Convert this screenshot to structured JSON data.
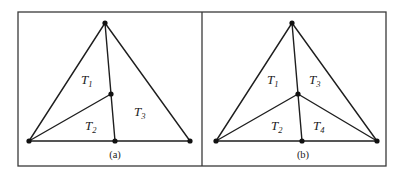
{
  "figure": {
    "panels": [
      {
        "id": "a",
        "caption": "(a)",
        "vertices": {
          "apex": [
            105,
            23
          ],
          "left": [
            29,
            141
          ],
          "interior": [
            111,
            94
          ],
          "bottom_mid": [
            115,
            141
          ],
          "right": [
            190,
            141
          ]
        },
        "labels": [
          {
            "base": "T",
            "sub": "1"
          },
          {
            "base": "T",
            "sub": "2"
          },
          {
            "base": "T",
            "sub": "3"
          }
        ]
      },
      {
        "id": "b",
        "caption": "(b)",
        "vertices": {
          "apex": [
            292,
            23
          ],
          "left": [
            216,
            141
          ],
          "interior": [
            298,
            94
          ],
          "bottom_mid": [
            302,
            141
          ],
          "right": [
            377,
            141
          ]
        },
        "labels": [
          {
            "base": "T",
            "sub": "1"
          },
          {
            "base": "T",
            "sub": "3"
          },
          {
            "base": "T",
            "sub": "2"
          },
          {
            "base": "T",
            "sub": "4"
          }
        ]
      }
    ],
    "colors": {
      "line": "#1e1e1e",
      "frame": "#3a3a3a",
      "background": "#ffffff"
    }
  }
}
